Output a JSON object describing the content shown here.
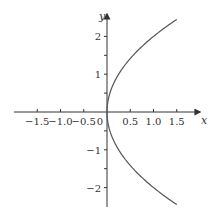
{
  "chart_data": {
    "type": "line",
    "title": "",
    "xlabel": "x",
    "ylabel": "y",
    "xlim": [
      -1.9,
      1.9
    ],
    "ylim": [
      -2.5,
      2.5
    ],
    "grid": false,
    "x_ticks": [
      -1.5,
      -1.0,
      -0.5,
      0,
      0.5,
      1.0,
      1.5
    ],
    "x_tick_labels": [
      "−1.5",
      "−1.0",
      "−0.5",
      "0",
      "0.5",
      "1.0",
      "1.5"
    ],
    "y_ticks": [
      -2,
      -1,
      1,
      2
    ],
    "y_tick_labels": [
      "−2",
      "−1",
      "1",
      "2"
    ],
    "series": [
      {
        "name": "x = y^2/4",
        "color": "#555555",
        "points": [
          {
            "x": 1.5,
            "y": -2.45
          },
          {
            "x": 1.0,
            "y": -2.0
          },
          {
            "x": 0.5625,
            "y": -1.5
          },
          {
            "x": 0.25,
            "y": -1.0
          },
          {
            "x": 0.0625,
            "y": -0.5
          },
          {
            "x": 0.0,
            "y": 0.0
          },
          {
            "x": 0.0625,
            "y": 0.5
          },
          {
            "x": 0.25,
            "y": 1.0
          },
          {
            "x": 0.5625,
            "y": 1.5
          },
          {
            "x": 1.0,
            "y": 2.0
          },
          {
            "x": 1.5,
            "y": 2.45
          }
        ]
      }
    ]
  }
}
